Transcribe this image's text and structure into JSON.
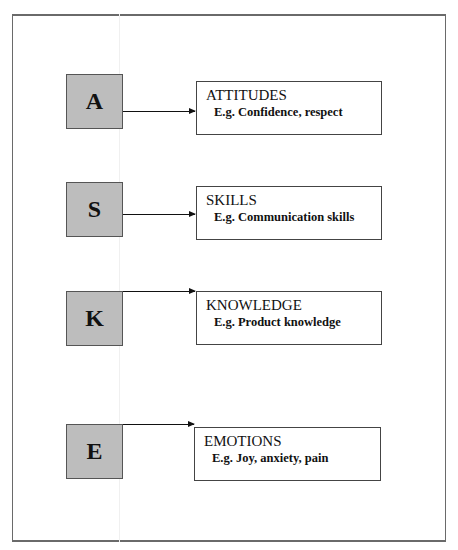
{
  "diagram": {
    "items": [
      {
        "letter": "A",
        "title": "ATTITUDES",
        "example": "E.g. Confidence, respect"
      },
      {
        "letter": "S",
        "title": "SKILLS",
        "example": "E.g. Communication skills"
      },
      {
        "letter": "K",
        "title": "KNOWLEDGE",
        "example": "E.g. Product knowledge"
      },
      {
        "letter": "E",
        "title": "EMOTIONS",
        "example": "E.g. Joy, anxiety, pain"
      }
    ]
  }
}
